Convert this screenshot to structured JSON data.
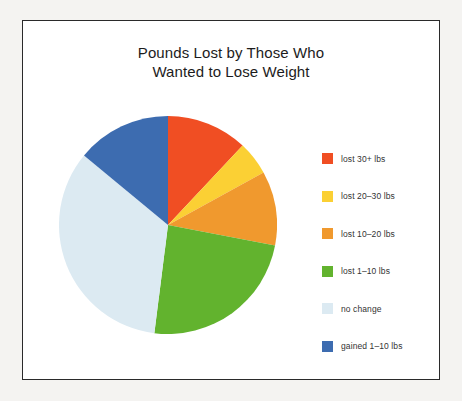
{
  "chart_data": {
    "type": "pie",
    "title": "Pounds Lost by Those Who Wanted to Lose Weight",
    "title_lines": [
      "Pounds Lost by Those Who",
      "Wanted to Lose Weight"
    ],
    "categories": [
      "lost 30+ lbs",
      "lost 20–30 lbs",
      "lost 10–20 lbs",
      "lost 1–10 lbs",
      "no change",
      "gained 1–10 lbs"
    ],
    "values": [
      12,
      5,
      11,
      24,
      34,
      14
    ],
    "colors": [
      "#f04e23",
      "#fbd034",
      "#f0992e",
      "#62b32e",
      "#dceaf2",
      "#3d6cb0"
    ],
    "legend_position": "right",
    "start_angle_deg": 0,
    "direction": "clockwise",
    "grid": false,
    "xlabel": "",
    "ylabel": ""
  },
  "legend": {
    "items": [
      {
        "label": "lost 30+ lbs",
        "color": "#f04e23"
      },
      {
        "label": "lost 20–30 lbs",
        "color": "#fbd034"
      },
      {
        "label": "lost 10–20 lbs",
        "color": "#f0992e"
      },
      {
        "label": "lost 1–10 lbs",
        "color": "#62b32e"
      },
      {
        "label": "no change",
        "color": "#dceaf2"
      },
      {
        "label": "gained 1–10 lbs",
        "color": "#3d6cb0"
      }
    ]
  }
}
